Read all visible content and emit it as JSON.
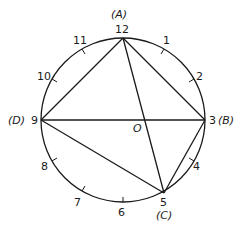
{
  "diagram": {
    "type": "clock-face circle with inscribed quadrilateral",
    "center_label": "O",
    "hour_labels": [
      "12",
      "1",
      "2",
      "3",
      "4",
      "5",
      "6",
      "7",
      "8",
      "9",
      "10",
      "11"
    ],
    "vertices": {
      "A": {
        "label": "(A)",
        "hour": "12"
      },
      "B": {
        "label": "(B)",
        "hour": "3"
      },
      "C": {
        "label": "(C)",
        "hour": "5"
      },
      "D": {
        "label": "(D)",
        "hour": "9"
      }
    },
    "segments": [
      "A-B",
      "A-C",
      "A-D",
      "D-B",
      "D-C",
      "B-C"
    ],
    "colors": {
      "stroke": "#1a1a1a",
      "background": "#ffffff"
    }
  }
}
